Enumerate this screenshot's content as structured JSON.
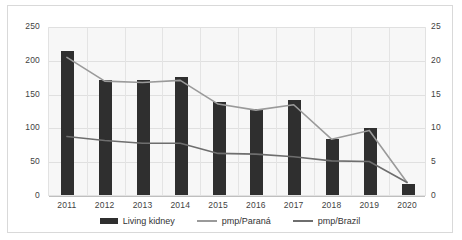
{
  "chart_data": {
    "type": "bar",
    "title": "",
    "subtitle": "",
    "xlabel": "",
    "ylabel": "",
    "y2label": "",
    "grid": true,
    "legend_position": "bottom",
    "categories": [
      "2011",
      "2012",
      "2013",
      "2014",
      "2015",
      "2016",
      "2017",
      "2018",
      "2019",
      "2020"
    ],
    "ylim": [
      0,
      250
    ],
    "y2lim": [
      0,
      25
    ],
    "yticks": [
      "0",
      "50",
      "100",
      "150",
      "200",
      "250"
    ],
    "y2ticks": [
      "0",
      "5",
      "10",
      "15",
      "20",
      "25"
    ],
    "series": [
      {
        "name": "Living kidney",
        "type": "bar",
        "axis": "left",
        "color": "#2f2f2f",
        "values": [
          213,
          170,
          170,
          175,
          137,
          127,
          140,
          83,
          99,
          17
        ]
      },
      {
        "name": "pmp/Paraná",
        "type": "line",
        "axis": "right",
        "color": "#9a9a9a",
        "values": [
          20.5,
          17.0,
          16.8,
          17.1,
          13.6,
          12.7,
          13.5,
          8.4,
          9.7,
          2.0
        ]
      },
      {
        "name": "pmp/Brazil",
        "type": "line",
        "axis": "right",
        "color": "#6e6e6e",
        "values": [
          8.8,
          8.2,
          7.8,
          7.8,
          6.3,
          6.2,
          5.8,
          5.2,
          5.1,
          2.0
        ]
      }
    ]
  },
  "legend": {
    "items": [
      {
        "label": "Living kidney",
        "marker": "bar-swatch"
      },
      {
        "label": "pmp/Paraná",
        "marker": "line-swatch"
      },
      {
        "label": "pmp/Brazil",
        "marker": "line-swatch-dark"
      }
    ]
  },
  "colors": {
    "bar": "#2f2f2f",
    "parana_line": "#9a9a9a",
    "brazil_line": "#6e6e6e",
    "plot_background": "#f7f7f7",
    "gridline": "#e0e0e0",
    "frame_border": "#d9d9d9"
  }
}
